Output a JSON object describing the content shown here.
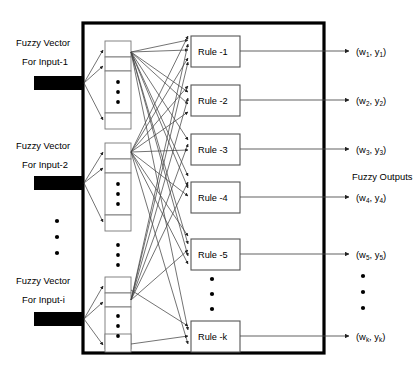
{
  "figure": {
    "background_color": "#ffffff",
    "line_color": "#444444",
    "border_color": "#000000",
    "bar_color": "#000000"
  },
  "inputs": {
    "label_line1": "Fuzzy Vector",
    "items": [
      {
        "line1": "Fuzzy Vector",
        "line2": "For Input-1"
      },
      {
        "line1": "Fuzzy Vector",
        "line2": "For Input-2"
      },
      {
        "line1": "Fuzzy Vector",
        "line2": "For Input-i"
      }
    ],
    "ellipsis_between": "vertical-dots"
  },
  "membership_columns": [
    {
      "name": "column-input-1",
      "cells": 3,
      "middle_dots": 3
    },
    {
      "name": "column-input-2",
      "cells": 3,
      "middle_dots": 3
    },
    {
      "name": "column-input-i",
      "cells": 3,
      "middle_dots": 3
    }
  ],
  "rules": [
    {
      "label": "Rule -1"
    },
    {
      "label": "Rule -2"
    },
    {
      "label": "Rule -3"
    },
    {
      "label": "Rule -4"
    },
    {
      "label": "Rule -5"
    },
    {
      "label": "Rule -k"
    }
  ],
  "rules_ellipsis": "vertical-dots",
  "outputs": {
    "heading": "Fuzzy Outputs",
    "items": [
      {
        "open": "(w",
        "sub1": "1",
        "mid": ", y",
        "sub2": "1",
        "close": ")"
      },
      {
        "open": "(w",
        "sub1": "2",
        "mid": ", y",
        "sub2": "2",
        "close": ")"
      },
      {
        "open": "(w",
        "sub1": "3",
        "mid": ", y",
        "sub2": "3",
        "close": ")"
      },
      {
        "open": "(w",
        "sub1": "4",
        "mid": ", y",
        "sub2": "4",
        "close": ")"
      },
      {
        "open": "(w",
        "sub1": "5",
        "mid": ", y",
        "sub2": "5",
        "close": ")"
      },
      {
        "open": "(w",
        "sub1": "k",
        "mid": ", y",
        "sub2": "k",
        "close": ")"
      }
    ],
    "ellipsis": "vertical-dots"
  }
}
